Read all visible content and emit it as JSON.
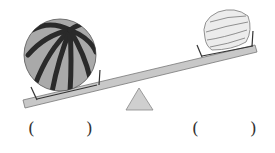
{
  "figure": {
    "type": "balance-seesaw",
    "left_item": "watermelon",
    "right_item": "bell-pepper",
    "heavier_side": "left"
  },
  "answers": [
    {
      "open": "(",
      "close": ")",
      "value": ""
    },
    {
      "open": "(",
      "close": ")",
      "value": ""
    }
  ],
  "colors": {
    "beam": "#c8c8c8",
    "fulcrum": "#cfcfcf",
    "melon": "#a9a9a9",
    "melon_stripes": "#2a2a2a",
    "pepper": "#ececec"
  }
}
